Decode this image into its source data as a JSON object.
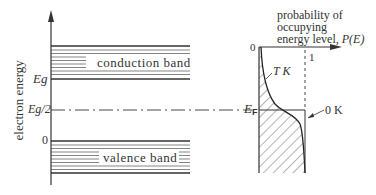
{
  "diagram": {
    "y_axis_label": "electron energy",
    "levels": {
      "eg": "Eg",
      "eg_half": "Eg/2",
      "zero": "0"
    },
    "bands": {
      "conduction": "conduction band",
      "valence": "valence band"
    },
    "fermi_label": "E",
    "fermi_sub": "F",
    "probability_plot": {
      "title_line1": "probability of",
      "title_line2": "occupying",
      "title_line3": "energy level, ",
      "title_func": "P(E)",
      "x_origin": "0",
      "x_one": "1",
      "curve_t_label": "T K",
      "curve_0_label": "0 K"
    },
    "colors": {
      "ink": "#333333",
      "background": "#ffffff"
    }
  }
}
